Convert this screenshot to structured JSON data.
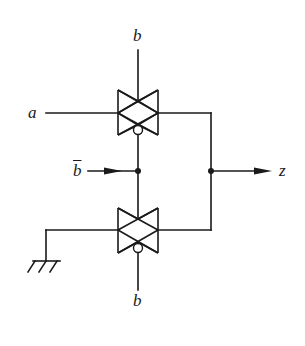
{
  "diagram": {
    "type": "CMOS transmission-gate circuit",
    "labels": {
      "input_a": "a",
      "control_top": "b",
      "control_bottom": "b",
      "control_inverted": "b",
      "control_inverted_note": "b with overbar (b̄)",
      "output": "z"
    },
    "components": [
      {
        "id": "tg-upper",
        "kind": "transmission gate",
        "inputs": [
          "a"
        ],
        "gate": "b",
        "gate_bar": "b̄",
        "output": "z"
      },
      {
        "id": "tg-lower",
        "kind": "transmission gate",
        "inputs": [
          "ground"
        ],
        "gate": "b̄",
        "gate_bar": "b",
        "output": "z"
      },
      {
        "id": "ground",
        "kind": "ground symbol"
      }
    ],
    "colors": {
      "line": "#1a1a1a",
      "background": "#ffffff"
    }
  }
}
